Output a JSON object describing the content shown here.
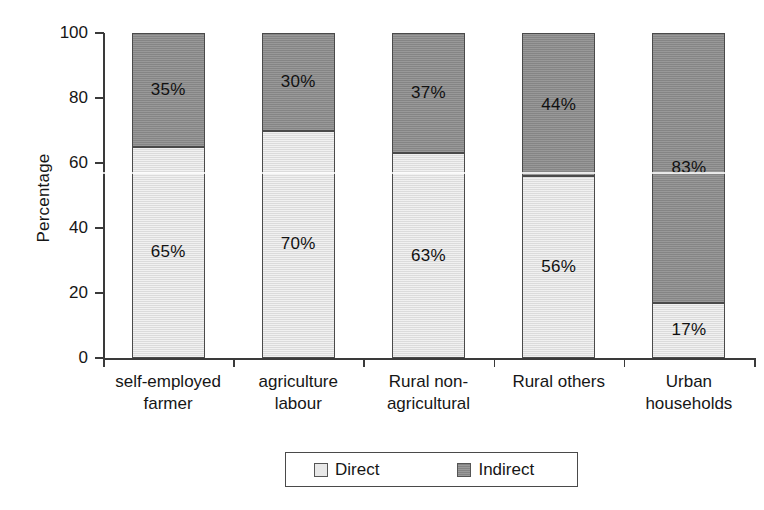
{
  "chart_data": {
    "type": "bar",
    "subtype": "stacked-bar-100",
    "title": "",
    "xlabel": "",
    "ylabel": "Percentage",
    "ylim": [
      0,
      100
    ],
    "yticks": [
      0,
      20,
      40,
      60,
      80,
      100
    ],
    "grid": false,
    "legend_position": "bottom-center",
    "categories": [
      "self-employed farmer",
      "agriculture labour",
      "Rural non-agricultural",
      "Rural others",
      "Urban households"
    ],
    "category_label_lines": [
      [
        "self-employed",
        "farmer"
      ],
      [
        "agriculture",
        "labour"
      ],
      [
        "Rural non-",
        "agricultural"
      ],
      [
        "Rural others",
        ""
      ],
      [
        "Urban",
        "households"
      ]
    ],
    "series": [
      {
        "name": "Direct",
        "color": "#e2e2e2",
        "values": [
          65,
          70,
          63,
          56,
          17
        ],
        "labels": [
          "65%",
          "70%",
          "63%",
          "56%",
          "17%"
        ]
      },
      {
        "name": "Indirect",
        "color": "#8c8c8c",
        "values": [
          35,
          30,
          37,
          44,
          83
        ],
        "labels": [
          "35%",
          "30%",
          "37%",
          "44%",
          "83%"
        ]
      }
    ],
    "legend": [
      {
        "label": "Direct",
        "swatch": "light-gray-square"
      },
      {
        "label": "Indirect",
        "swatch": "dark-gray-square"
      }
    ]
  },
  "axis": {
    "y_title": "Percentage",
    "y_ticks": [
      "0",
      "20",
      "40",
      "60",
      "80",
      "100"
    ]
  },
  "bars": [
    {
      "category_line1": "self-employed",
      "category_line2": "farmer",
      "direct_label": "65%",
      "indirect_label": "35%"
    },
    {
      "category_line1": "agriculture",
      "category_line2": "labour",
      "direct_label": "70%",
      "indirect_label": "30%"
    },
    {
      "category_line1": "Rural non-",
      "category_line2": "agricultural",
      "direct_label": "63%",
      "indirect_label": "37%"
    },
    {
      "category_line1": "Rural others",
      "category_line2": "",
      "direct_label": "56%",
      "indirect_label": "44%"
    },
    {
      "category_line1": "Urban",
      "category_line2": "households",
      "direct_label": "17%",
      "indirect_label": "83%"
    }
  ],
  "legend": {
    "direct_label": "Direct",
    "indirect_label": "Indirect"
  },
  "colors": {
    "direct": "#e2e2e2",
    "indirect": "#8c8c8c",
    "axis": "#3a3a3a",
    "text": "#161616",
    "background": "#ffffff"
  }
}
